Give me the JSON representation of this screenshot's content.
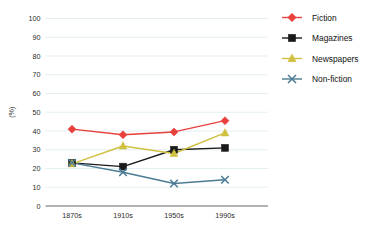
{
  "chart_data": {
    "type": "line",
    "title": "",
    "xlabel": "",
    "ylabel": "(%)",
    "categories": [
      "1870s",
      "1910s",
      "1950s",
      "1990s"
    ],
    "ylim": [
      0,
      100
    ],
    "yticks": [
      0,
      10,
      20,
      30,
      40,
      50,
      60,
      70,
      80,
      90,
      100
    ],
    "ytick_labels": [
      "0",
      "10",
      "20",
      "30",
      "40",
      "50",
      "60",
      "70",
      "80",
      "90",
      "100"
    ],
    "grid": true,
    "legend_position": "right",
    "series": [
      {
        "name": "Fiction",
        "color": "#e8413c",
        "marker": "diamond",
        "values": [
          41,
          38,
          39.5,
          45.5
        ]
      },
      {
        "name": "Magazines",
        "color": "#1a1a1a",
        "marker": "square",
        "values": [
          23,
          21,
          30,
          31
        ]
      },
      {
        "name": "Newspapers",
        "color": "#cfc040",
        "marker": "triangle",
        "values": [
          22.5,
          32,
          28,
          39
        ]
      },
      {
        "name": "Non-fiction",
        "color": "#4a7c94",
        "marker": "x",
        "values": [
          23,
          18,
          12,
          14
        ]
      }
    ]
  },
  "style": {
    "grid_color": "#e4eff1",
    "axis_color": "#9a9a9a",
    "background": "#ffffff"
  }
}
